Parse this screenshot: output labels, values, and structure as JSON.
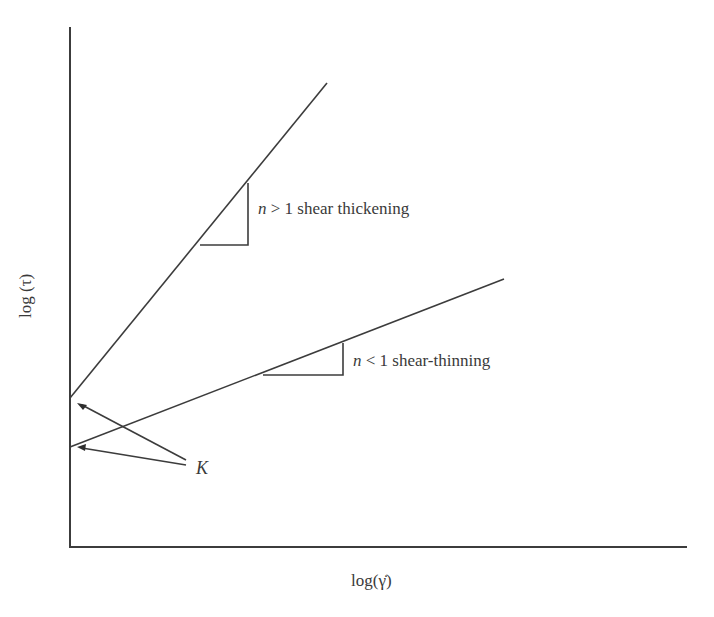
{
  "diagram": {
    "title": "",
    "type": "log-log rheology flow curve (power-law fluids)",
    "x_axis": {
      "label": "log(γ̇)"
    },
    "y_axis": {
      "label": "log (τ)"
    },
    "lines": [
      {
        "name": "shear-thickening",
        "slope_label_var": "n",
        "slope_label_rel": " > 1 ",
        "slope_label_text": "shear thickening"
      },
      {
        "name": "shear-thinning",
        "slope_label_var": "n",
        "slope_label_rel": " < 1 ",
        "slope_label_text": "shear-thinning"
      }
    ],
    "intercept_label": "K",
    "colors": {
      "line": "#3c3c3c",
      "background": "#ffffff",
      "text": "#3a3a3a"
    }
  }
}
